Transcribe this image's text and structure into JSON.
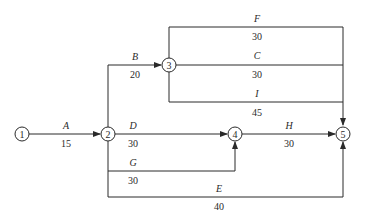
{
  "diagram": {
    "type": "activity-on-arrow network",
    "nodes": [
      {
        "id": "1",
        "label": "1"
      },
      {
        "id": "2",
        "label": "2"
      },
      {
        "id": "3",
        "label": "3"
      },
      {
        "id": "4",
        "label": "4"
      },
      {
        "id": "5",
        "label": "5"
      }
    ],
    "activities": [
      {
        "name": "A",
        "duration": "15",
        "from": "1",
        "to": "2"
      },
      {
        "name": "B",
        "duration": "20",
        "from": "2",
        "to": "3"
      },
      {
        "name": "F",
        "duration": "30",
        "from": "3",
        "to": "5"
      },
      {
        "name": "C",
        "duration": "30",
        "from": "3",
        "to": "5"
      },
      {
        "name": "I",
        "duration": "45",
        "from": "3",
        "to": "5"
      },
      {
        "name": "D",
        "duration": "30",
        "from": "2",
        "to": "4"
      },
      {
        "name": "G",
        "duration": "30",
        "from": "2",
        "to": "4"
      },
      {
        "name": "H",
        "duration": "30",
        "from": "4",
        "to": "5"
      },
      {
        "name": "E",
        "duration": "40",
        "from": "2",
        "to": "5"
      }
    ]
  }
}
